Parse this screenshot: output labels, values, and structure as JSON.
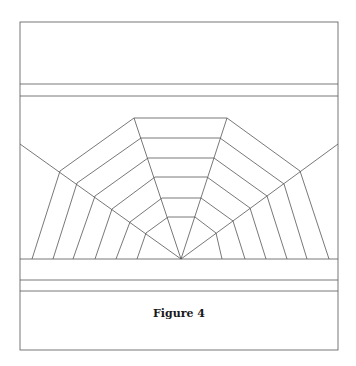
{
  "figure": {
    "caption": "Figure 4",
    "line_color": "#555555",
    "frame": {
      "x1": 20,
      "y1": 22,
      "x2": 338,
      "y2": 350
    },
    "horizontal_lines_y": [
      84,
      96,
      259,
      280,
      291
    ],
    "center": [
      181,
      259
    ],
    "rays": [
      [
        20,
        144
      ],
      [
        134,
        118
      ],
      [
        227,
        118
      ],
      [
        338,
        144
      ]
    ],
    "rings": [
      [
        [
          32,
          259
        ],
        [
          60,
          171
        ],
        [
          134,
          118
        ],
        [
          227,
          118
        ],
        [
          300,
          171
        ],
        [
          329,
          259
        ]
      ],
      [
        [
          53,
          259
        ],
        [
          77,
          183
        ],
        [
          141,
          138
        ],
        [
          220,
          138
        ],
        [
          284,
          184
        ],
        [
          307,
          259
        ]
      ],
      [
        [
          73,
          259
        ],
        [
          95,
          196
        ],
        [
          148,
          158
        ],
        [
          214,
          158
        ],
        [
          267,
          196
        ],
        [
          287,
          259
        ]
      ],
      [
        [
          95,
          259
        ],
        [
          112,
          209
        ],
        [
          155,
          177
        ],
        [
          207,
          177
        ],
        [
          250,
          208
        ],
        [
          266,
          259
        ]
      ],
      [
        [
          116,
          259
        ],
        [
          130,
          222
        ],
        [
          162,
          198
        ],
        [
          201,
          198
        ],
        [
          233,
          221
        ],
        [
          245,
          259
        ]
      ],
      [
        [
          137,
          259
        ],
        [
          146,
          233
        ],
        [
          168,
          217
        ],
        [
          195,
          217
        ],
        [
          216,
          233
        ],
        [
          222,
          259
        ]
      ]
    ]
  }
}
